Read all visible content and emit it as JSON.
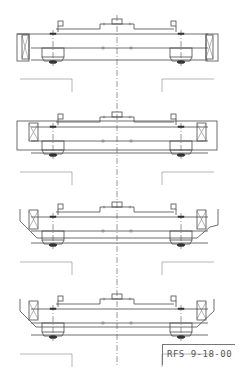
{
  "drawing": {
    "title_block": {
      "label": "RFS 9-18-00"
    },
    "views": [
      {
        "id": "view-1",
        "variant": "box-end-truck",
        "y": 0
      },
      {
        "id": "view-2",
        "variant": "rect-end-frame",
        "y": 93
      },
      {
        "id": "view-3",
        "variant": "tapered-end-frame-with-notch",
        "y": 183
      },
      {
        "id": "view-4",
        "variant": "tapered-end-frame",
        "y": 275
      }
    ],
    "colors": {
      "line": "#4a4a4a",
      "background": "#ffffff"
    }
  }
}
